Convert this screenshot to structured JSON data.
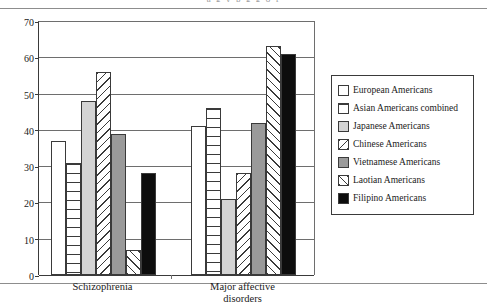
{
  "page": {
    "cutoff_header_text": "a  g  y  p  g g   o  f"
  },
  "chart_data": {
    "type": "bar",
    "title": "",
    "xlabel": "",
    "ylabel": "",
    "ylim": [
      0,
      70
    ],
    "ytick_step": 10,
    "yticks": [
      0,
      10,
      20,
      30,
      40,
      50,
      60,
      70
    ],
    "ytick_labels": [
      "0",
      "10",
      "20",
      "30",
      "40",
      "50",
      "60",
      "70"
    ],
    "grid": true,
    "legend_position": "right",
    "categories": [
      "Schizophrenia",
      "Major affective\ndisorders"
    ],
    "series": [
      {
        "name": "European Americans",
        "pattern": "white",
        "values": [
          37,
          41
        ]
      },
      {
        "name": "Asian Americans combined",
        "pattern": "hstripe",
        "values": [
          31,
          46
        ]
      },
      {
        "name": "Japanese Americans",
        "pattern": "lightgray",
        "values": [
          48,
          21
        ]
      },
      {
        "name": "Chinese Americans",
        "pattern": "diag-down",
        "values": [
          56,
          28
        ]
      },
      {
        "name": "Vietnamese Americans",
        "pattern": "midgray",
        "values": [
          39,
          42
        ]
      },
      {
        "name": "Laotian Americans",
        "pattern": "diag-up",
        "values": [
          7,
          63
        ]
      },
      {
        "name": "Filipino Americans",
        "pattern": "black",
        "values": [
          28,
          61
        ]
      }
    ]
  },
  "colors": {
    "axis": "#3a3a3a",
    "grid": "#6e6e6e",
    "light_gray_fill": "#d4d4d4",
    "mid_gray_fill": "#9a9a9a",
    "black_fill": "#0d0d0d",
    "page_rule": "#8d8d8d"
  }
}
